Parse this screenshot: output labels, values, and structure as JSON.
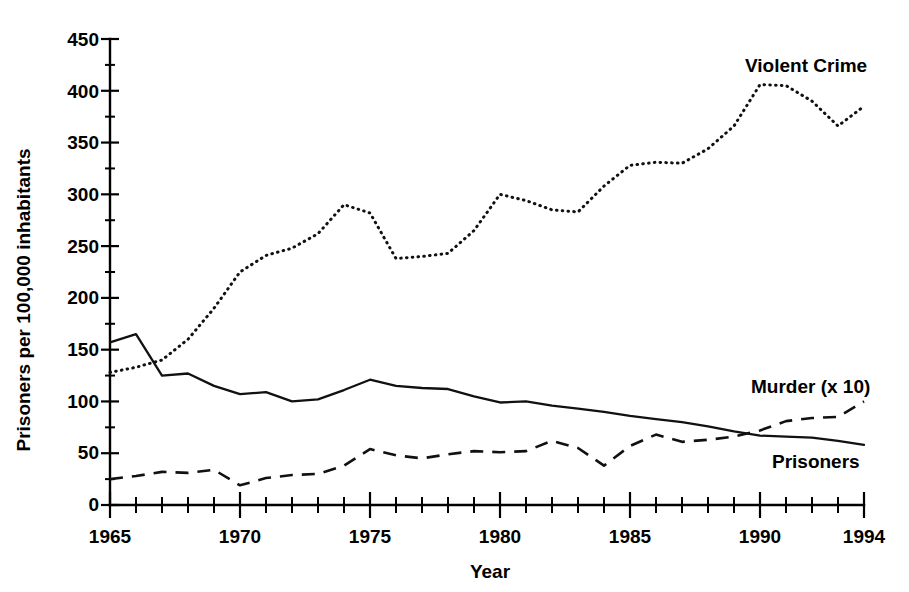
{
  "chart_data": {
    "type": "line",
    "title": "",
    "xlabel": "Year",
    "ylabel": "Prisoners per 100,000 inhabitants",
    "xlim": [
      1965,
      1994
    ],
    "ylim": [
      0,
      450
    ],
    "grid": false,
    "legend_position": "inline-annotations",
    "x": [
      1965,
      1966,
      1967,
      1968,
      1969,
      1970,
      1971,
      1972,
      1973,
      1974,
      1975,
      1976,
      1977,
      1978,
      1979,
      1980,
      1981,
      1982,
      1983,
      1984,
      1985,
      1986,
      1987,
      1988,
      1989,
      1990,
      1991,
      1992,
      1993,
      1994
    ],
    "x_ticks_major": [
      1965,
      1970,
      1975,
      1980,
      1985,
      1990,
      1994
    ],
    "x_tick_labels": [
      "1965",
      "1970",
      "1975",
      "1980",
      "1985",
      "1990",
      "1994"
    ],
    "y_ticks": [
      0,
      50,
      100,
      150,
      200,
      250,
      300,
      350,
      400,
      450
    ],
    "y_tick_labels": [
      "0",
      "50",
      "100",
      "150",
      "200",
      "250",
      "300",
      "350",
      "400",
      "450"
    ],
    "series": [
      {
        "name": "Violent Crime",
        "label": "Violent Crime",
        "style": "dotted",
        "values": [
          128,
          133,
          140,
          160,
          190,
          225,
          241,
          248,
          262,
          290,
          282,
          238,
          240,
          243,
          265,
          300,
          294,
          285,
          283,
          308,
          328,
          331,
          330,
          344,
          366,
          406,
          405,
          390,
          366,
          385
        ]
      },
      {
        "name": "Prisoners",
        "label": "Prisoners",
        "style": "solid",
        "values": [
          157,
          165,
          125,
          127,
          115,
          107,
          109,
          100,
          102,
          111,
          121,
          115,
          113,
          112,
          105,
          99,
          100,
          96,
          93,
          90,
          86,
          83,
          80,
          76,
          71,
          67,
          66,
          65,
          62,
          58
        ]
      },
      {
        "name": "Murder (x 10)",
        "label": "Murder (x 10)",
        "style": "dashed",
        "values": [
          25,
          28,
          32,
          31,
          34,
          19,
          26,
          29,
          30,
          38,
          54,
          48,
          45,
          49,
          52,
          51,
          52,
          62,
          55,
          38,
          57,
          68,
          61,
          63,
          66,
          72,
          81,
          84,
          85,
          100
        ]
      }
    ],
    "annotations": [
      {
        "text": "Violent Crime",
        "series": "Violent Crime"
      },
      {
        "text": "Murder (x 10)",
        "series": "Murder (x 10)"
      },
      {
        "text": "Prisoners",
        "series": "Prisoners"
      }
    ]
  },
  "axes": {
    "y_title": "Prisoners per 100,000 inhabitants",
    "x_title": "Year",
    "y_labels": [
      "450",
      "400",
      "350",
      "300",
      "250",
      "200",
      "150",
      "100",
      "50",
      "0"
    ],
    "x_labels": [
      "1965",
      "1970",
      "1975",
      "1980",
      "1985",
      "1990",
      "1994"
    ]
  },
  "labels": {
    "violent_crime": "Violent Crime",
    "murder": "Murder (x 10)",
    "prisoners": "Prisoners"
  },
  "colors": {
    "ink": "#000000",
    "background": "#ffffff"
  }
}
